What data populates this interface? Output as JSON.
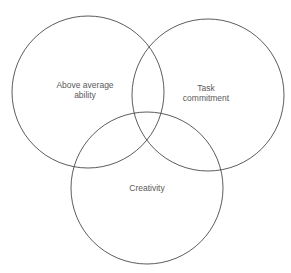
{
  "diagram": {
    "type": "venn",
    "circles": [
      {
        "id": "ability",
        "label_lines": [
          "Above average",
          "ability"
        ],
        "cx": 88,
        "cy": 92,
        "r": 76
      },
      {
        "id": "task",
        "label_lines": [
          "Task",
          "commitment"
        ],
        "cx": 208,
        "cy": 95,
        "r": 76
      },
      {
        "id": "creativity",
        "label_lines": [
          "Creativity"
        ],
        "cx": 147,
        "cy": 188,
        "r": 76
      }
    ],
    "colors": {
      "stroke": "#4a4a4a",
      "text": "#5a5a5a",
      "background": "#ffffff"
    }
  }
}
